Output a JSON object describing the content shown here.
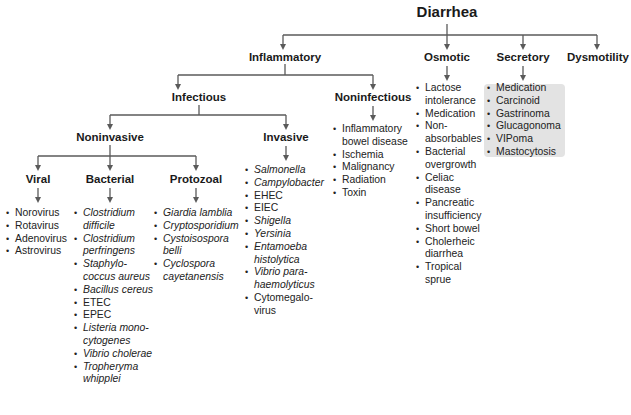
{
  "root": {
    "label": "Diarrhea"
  },
  "level1": {
    "inflammatory": "Inflammatory",
    "osmotic": "Osmotic",
    "secretory": "Secretory",
    "dysmotility": "Dysmotility"
  },
  "inflammatory_children": {
    "infectious": "Infectious",
    "noninfectious": "Noninfectious"
  },
  "infectious_children": {
    "noninvasive": "Noninvasive",
    "invasive": "Invasive"
  },
  "noninvasive_children": {
    "viral": "Viral",
    "bacterial": "Bacterial",
    "protozoal": "Protozoal"
  },
  "lists": {
    "viral": [
      {
        "text": "Norovirus",
        "italic": false
      },
      {
        "text": "Rotavirus",
        "italic": false
      },
      {
        "text": "Adenovirus",
        "italic": false
      },
      {
        "text": "Astrovirus",
        "italic": false
      }
    ],
    "bacterial": [
      {
        "text": "Clostridium difficile",
        "italic": true
      },
      {
        "text": "Clostridium perfringens",
        "italic": true
      },
      {
        "text": "Staphylo-coccus aureus",
        "italic": true
      },
      {
        "text": "Bacillus cereus",
        "italic": true
      },
      {
        "text": "ETEC",
        "italic": false
      },
      {
        "text": "EPEC",
        "italic": false
      },
      {
        "text": "Listeria mono-cytogenes",
        "italic": true
      },
      {
        "text": "Vibrio cholerae",
        "italic": true
      },
      {
        "text": "Tropheryma whipplei",
        "italic": true
      }
    ],
    "protozoal": [
      {
        "text": "Giardia lamblia",
        "italic": true
      },
      {
        "text": "Cryptosporidium",
        "italic": true
      },
      {
        "text": "Cystoisospora belli",
        "italic": true
      },
      {
        "text": "Cyclospora cayetanensis",
        "italic": true
      }
    ],
    "invasive": [
      {
        "text": "Salmonella",
        "italic": true
      },
      {
        "text": "Campylobacter",
        "italic": true
      },
      {
        "text": "EHEC",
        "italic": false
      },
      {
        "text": "EIEC",
        "italic": false
      },
      {
        "text": "Shigella",
        "italic": true
      },
      {
        "text": "Yersinia",
        "italic": true
      },
      {
        "text": "Entamoeba histolytica",
        "italic": true
      },
      {
        "text": "Vibrio para-haemolyticus",
        "italic": true
      },
      {
        "text": "Cytomegalo-virus",
        "italic": false
      }
    ],
    "noninfectious": [
      {
        "text": "Inflammatory bowel disease",
        "italic": false
      },
      {
        "text": "Ischemia",
        "italic": false
      },
      {
        "text": "Malignancy",
        "italic": false
      },
      {
        "text": "Radiation",
        "italic": false
      },
      {
        "text": "Toxin",
        "italic": false
      }
    ],
    "osmotic": [
      {
        "text": "Lactose intolerance",
        "italic": false
      },
      {
        "text": "Medication",
        "italic": false
      },
      {
        "text": "Non-absorbables",
        "italic": false
      },
      {
        "text": "Bacterial overgrowth",
        "italic": false
      },
      {
        "text": "Celiac disease",
        "italic": false
      },
      {
        "text": "Pancreatic insufficiency",
        "italic": false
      },
      {
        "text": "Short bowel",
        "italic": false
      },
      {
        "text": "Cholerheic diarrhea",
        "italic": false
      },
      {
        "text": "Tropical sprue",
        "italic": false
      }
    ],
    "secretory": [
      {
        "text": "Medication",
        "italic": false
      },
      {
        "text": "Carcinoid",
        "italic": false
      },
      {
        "text": "Gastrinoma",
        "italic": false
      },
      {
        "text": "Glucagonoma",
        "italic": false
      },
      {
        "text": "VIPoma",
        "italic": false
      },
      {
        "text": "Mastocytosis",
        "italic": false
      }
    ]
  },
  "colors": {
    "line": "#5a5a5a",
    "text": "#1a1a1a",
    "secretory_box": "#e3e3e3"
  }
}
